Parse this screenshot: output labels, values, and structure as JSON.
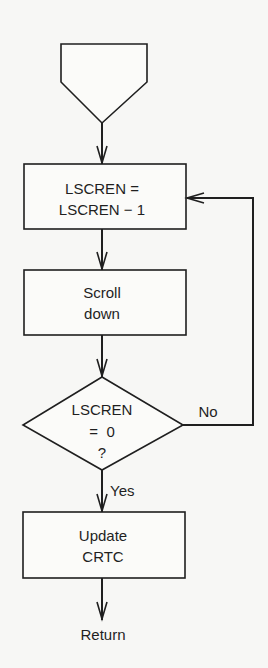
{
  "diagram": {
    "type": "flowchart",
    "start_connector": {
      "shape": "offpage-connector",
      "label": ""
    },
    "nodes": [
      {
        "id": "decrement",
        "shape": "process",
        "lines": [
          "LSCREN =",
          "LSCREN − 1"
        ]
      },
      {
        "id": "scroll",
        "shape": "process",
        "lines": [
          "Scroll",
          "down"
        ]
      },
      {
        "id": "check",
        "shape": "decision",
        "lines": [
          "LSCREN",
          "=  0",
          "?"
        ]
      },
      {
        "id": "update",
        "shape": "process",
        "lines": [
          "Update",
          "CRTC"
        ]
      }
    ],
    "edges": [
      {
        "from": "start_connector",
        "to": "decrement",
        "label": ""
      },
      {
        "from": "decrement",
        "to": "scroll",
        "label": ""
      },
      {
        "from": "scroll",
        "to": "check",
        "label": ""
      },
      {
        "from": "check",
        "to": "decrement",
        "label": "No"
      },
      {
        "from": "check",
        "to": "update",
        "label": "Yes"
      },
      {
        "from": "update",
        "to": "return",
        "label": ""
      }
    ],
    "labels": {
      "no": "No",
      "yes": "Yes",
      "return": "Return"
    },
    "colors": {
      "ink": "#1f1f1f",
      "paper": "#f7f7f5"
    }
  }
}
